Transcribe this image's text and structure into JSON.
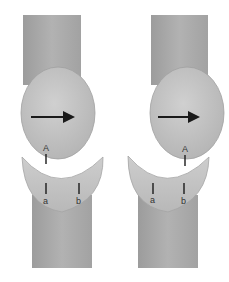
{
  "figure": {
    "colors": {
      "shaft": "#a8a8a8",
      "shaft_edge": "#8c8c8c",
      "head": "#c2c2c2",
      "head_edge": "#9a9a9a",
      "socket": "#c6c6c6",
      "socket_edge": "#9e9e9e",
      "marks": "#1a1a1a",
      "background": "#ffffff"
    },
    "panels": [
      {
        "id": "left",
        "arrow_direction": "right",
        "labels": {
          "head_point": "A",
          "socket_point_1": "a",
          "socket_point_2": "b"
        },
        "note": "Point A aligned with point a"
      },
      {
        "id": "right",
        "arrow_direction": "right",
        "labels": {
          "head_point": "A",
          "socket_point_1": "a",
          "socket_point_2": "b"
        },
        "note": "Point A aligned with point b"
      }
    ]
  }
}
